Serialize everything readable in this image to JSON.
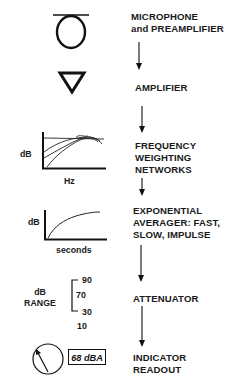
{
  "stages": [
    {
      "id": "microphone",
      "label_lines": [
        "MICROPHONE",
        "and PREAMPLIFIER"
      ],
      "icon": "microphone-icon"
    },
    {
      "id": "amplifier",
      "label_lines": [
        "AMPLIFIER"
      ],
      "icon": "amplifier-triangle-icon"
    },
    {
      "id": "weighting",
      "label_lines": [
        "FREQUENCY",
        "WEIGHTING",
        "NETWORKS"
      ],
      "icon": "frequency-response-graph-icon",
      "graph": {
        "ylabel": "dB",
        "xlabel": "Hz"
      }
    },
    {
      "id": "averager",
      "label_lines": [
        "EXPONENTIAL",
        "AVERAGER: FAST,",
        "SLOW, IMPULSE"
      ],
      "icon": "exponential-curve-graph-icon",
      "graph": {
        "ylabel": "dB",
        "xlabel": "seconds"
      }
    },
    {
      "id": "attenuator",
      "label_lines": [
        "ATTENUATOR"
      ],
      "icon": "range-bracket-icon",
      "range": {
        "label_lines": [
          "dB",
          "RANGE"
        ],
        "values": [
          "90",
          "70",
          "30",
          "10"
        ]
      }
    },
    {
      "id": "indicator",
      "label_lines": [
        "INDICATOR",
        "READOUT"
      ],
      "icon": "meter-dial-icon",
      "readout": "68 dBA"
    }
  ],
  "colors": {
    "ink": "#111111",
    "background": "#ffffff"
  }
}
